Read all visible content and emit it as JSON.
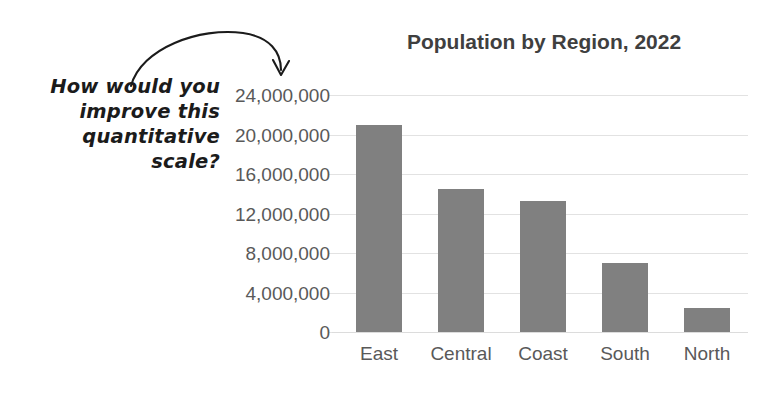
{
  "annotation": {
    "lines": [
      "How would you",
      "improve this",
      "quantitative",
      "scale?"
    ],
    "arrow_target": "24,000,000",
    "ink_color": "#1b1b1b"
  },
  "chart_data": {
    "type": "bar",
    "title": "Population by Region, 2022",
    "xlabel": "",
    "ylabel": "",
    "categories": [
      "East",
      "Central",
      "Coast",
      "South",
      "North"
    ],
    "values": [
      21000000,
      14500000,
      13300000,
      7000000,
      2400000
    ],
    "ylim": [
      0,
      24000000
    ],
    "ytick_values": [
      0,
      4000000,
      8000000,
      12000000,
      16000000,
      20000000,
      24000000
    ],
    "ytick_labels": [
      "0",
      "4,000,000",
      "8,000,000",
      "12,000,000",
      "16,000,000",
      "20,000,000",
      "24,000,000"
    ],
    "grid": true,
    "legend": false,
    "bar_color": "#808080",
    "gridline_color": "#e2e2e2",
    "tick_label_color": "#595959",
    "title_color": "#3f3f3f"
  }
}
